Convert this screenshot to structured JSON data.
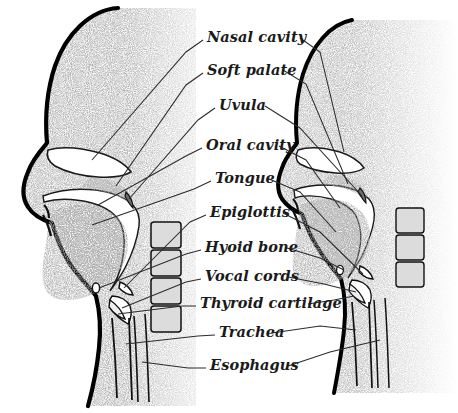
{
  "diagram": {
    "background_color": "#ffffff",
    "outline_color": "#000000",
    "tissue_fill": "#808080",
    "airway_fill": "#ffffff",
    "vertebra_fill": "#d9d9d9",
    "leader_line_color": "#2b2b2b",
    "label_color": "#1a1a1a"
  },
  "labels": [
    {
      "id": "nasal-cavity",
      "text": "Nasal cavity",
      "x": 207,
      "y": 42
    },
    {
      "id": "soft-palate",
      "text": "Soft palate",
      "x": 207,
      "y": 75
    },
    {
      "id": "uvula",
      "text": "Uvula",
      "x": 219,
      "y": 110
    },
    {
      "id": "oral-cavity",
      "text": "Oral cavity",
      "x": 206,
      "y": 150
    },
    {
      "id": "tongue",
      "text": "Tongue",
      "x": 215,
      "y": 183
    },
    {
      "id": "epiglottis",
      "text": "Epiglottis",
      "x": 210,
      "y": 217
    },
    {
      "id": "hyoid-bone",
      "text": "Hyoid bone",
      "x": 205,
      "y": 252
    },
    {
      "id": "vocal-cords",
      "text": "Vocal cords",
      "x": 205,
      "y": 281
    },
    {
      "id": "thyroid-cartilage",
      "text": "Thyroid cartilage",
      "x": 200,
      "y": 308
    },
    {
      "id": "trachea",
      "text": "Trachea",
      "x": 219,
      "y": 337
    },
    {
      "id": "esophagus",
      "text": "Esophagus",
      "x": 210,
      "y": 370
    }
  ],
  "heads": [
    {
      "id": "left-head",
      "caption": "Left profile — resting / nasal breathing position"
    },
    {
      "id": "right-head",
      "caption": "Right profile — mirrored articulation position"
    }
  ],
  "structures": [
    "nasal cavity",
    "soft palate",
    "uvula",
    "oral cavity",
    "tongue",
    "epiglottis",
    "hyoid bone",
    "vocal cords",
    "thyroid cartilage",
    "trachea",
    "esophagus",
    "cervical vertebrae"
  ]
}
